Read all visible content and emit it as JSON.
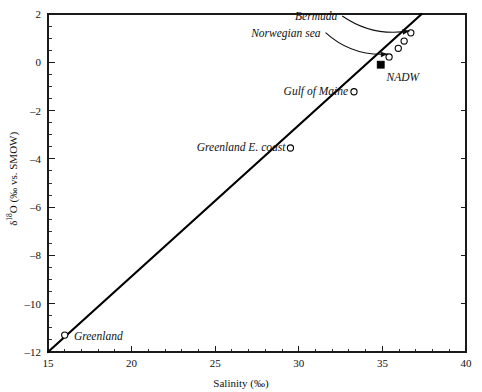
{
  "chart_data": {
    "type": "line",
    "title": "",
    "subtitle": "",
    "xlabel": "Salinity (‰)",
    "ylabel": "δ¹⁸O (‰ vs. SMOW)",
    "ylabel_parts": {
      "delta": "δ",
      "superscript": "18",
      "element": "O",
      "units": " (‰ vs. SMOW)"
    },
    "xlim": [
      15,
      40
    ],
    "ylim": [
      -12,
      2
    ],
    "xticks": [
      15,
      20,
      25,
      30,
      35,
      40
    ],
    "xticklabels": [
      "15",
      "20",
      "25",
      "30",
      "35",
      "40"
    ],
    "yticks": [
      2,
      0,
      -2,
      -4,
      -6,
      -8,
      -10,
      -12
    ],
    "yticklabels": [
      "2",
      "0",
      "–2",
      "–4",
      "–6",
      "–8",
      "–10",
      "–12"
    ],
    "x_minor_step": 1,
    "y_minor_step": 0.5,
    "grid": false,
    "legend": "none",
    "frame": "box",
    "line_color": "#000000",
    "marker_edge_color": "#000000",
    "marker_face_color": "#ffffff",
    "series": [
      {
        "name": "mixing line",
        "style": "solid",
        "width": 2.2,
        "x": [
          15.0,
          37.35
        ],
        "y": [
          -12.0,
          2.0
        ]
      }
    ],
    "points": [
      {
        "label": "Greenland",
        "x": 16.0,
        "y": -11.3,
        "marker": "open-circle"
      },
      {
        "label": "Greenland E. coast",
        "x": 29.5,
        "y": -3.55,
        "marker": "open-circle"
      },
      {
        "label": "Gulf of Maine",
        "x": 33.3,
        "y": -1.22,
        "marker": "open-circle"
      },
      {
        "label": "Norwegian sea",
        "x": 35.4,
        "y": 0.22,
        "marker": "open-circle"
      },
      {
        "label": "NADW",
        "x": 34.9,
        "y": -0.1,
        "marker": "filled-square"
      },
      {
        "label": "",
        "x": 35.95,
        "y": 0.58,
        "marker": "open-circle"
      },
      {
        "label": "",
        "x": 36.3,
        "y": 0.88,
        "marker": "open-circle"
      },
      {
        "label": "Bermuda",
        "x": 36.7,
        "y": 1.22,
        "marker": "open-circle"
      }
    ],
    "annotations": [
      {
        "text": "Bermuda",
        "x": 32.3,
        "y": 1.92,
        "align": "right",
        "arrow_to": {
          "x": 36.62,
          "y": 1.3
        }
      },
      {
        "text": "Norwegian sea",
        "x": 31.3,
        "y": 1.23,
        "align": "right",
        "arrow_to": {
          "x": 35.32,
          "y": 0.34
        }
      },
      {
        "text": "NADW",
        "x": 35.25,
        "y": -0.6,
        "align": "left",
        "arrow_to": null
      },
      {
        "text": "Gulf of Maine",
        "x": 32.95,
        "y": -1.18,
        "align": "right",
        "arrow_to": null
      },
      {
        "text": "Greenland E. coast",
        "x": 29.2,
        "y": -3.52,
        "align": "right",
        "arrow_to": null
      },
      {
        "text": "Greenland",
        "x": 16.55,
        "y": -11.33,
        "align": "left",
        "arrow_to": null
      }
    ]
  },
  "plot_area": {
    "left": 48,
    "top": 14,
    "right": 466,
    "bottom": 352
  }
}
